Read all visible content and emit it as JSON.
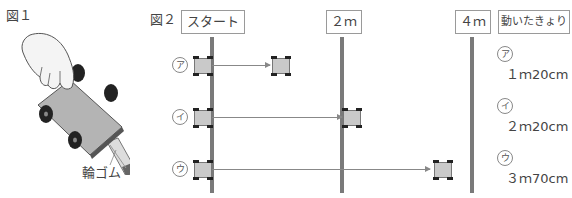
{
  "figure1": {
    "label": "図１",
    "rubber_band_label": "輪ゴム"
  },
  "figure2": {
    "label": "図２",
    "headers": {
      "start": "スタート",
      "two_m": "２ｍ",
      "four_m": "４ｍ",
      "distance": "動いたきょり"
    },
    "rows": [
      {
        "marker": "ア",
        "distance": "１ｍ20cm"
      },
      {
        "marker": "イ",
        "distance": "２ｍ20cm"
      },
      {
        "marker": "ウ",
        "distance": "３ｍ70cm"
      }
    ]
  }
}
